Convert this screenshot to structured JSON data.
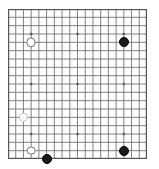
{
  "widget": {
    "name": "go-board",
    "board_size": 19,
    "background_color": "#ffffff",
    "board_color": "#fdfdfd",
    "line_color": "#6e6e6e",
    "border_color": "#555555",
    "black_color": "#1a1a1a",
    "white_color": "#ffffff"
  },
  "board": {
    "columns": 19,
    "rows": 19,
    "origin_x": 8,
    "origin_y": 9,
    "cell_size": 7.72,
    "star_points": [
      {
        "col": 3,
        "row": 3
      },
      {
        "col": 9,
        "row": 3
      },
      {
        "col": 15,
        "row": 3
      },
      {
        "col": 3,
        "row": 9
      },
      {
        "col": 9,
        "row": 9
      },
      {
        "col": 15,
        "row": 9
      },
      {
        "col": 3,
        "row": 15
      },
      {
        "col": 9,
        "row": 15
      },
      {
        "col": 15,
        "row": 15
      }
    ]
  },
  "stones": [
    {
      "id": "w1",
      "color": "white",
      "col": 3,
      "row": 4,
      "radius": 4.6,
      "faint": false,
      "label": "white-stone-upper-left"
    },
    {
      "id": "b1",
      "color": "black",
      "col": 15,
      "row": 4,
      "radius": 5.0,
      "faint": false,
      "label": "black-stone-upper-right"
    },
    {
      "id": "w2",
      "color": "white",
      "col": 2,
      "row": 13,
      "radius": 4.2,
      "faint": true,
      "label": "white-stone-left-middle"
    },
    {
      "id": "w3",
      "color": "white",
      "col": 3,
      "row": 17,
      "radius": 4.4,
      "faint": false,
      "label": "white-stone-lower-left"
    },
    {
      "id": "b2",
      "color": "black",
      "col": 5,
      "row": 18,
      "radius": 5.0,
      "faint": false,
      "label": "black-stone-bottom-left"
    },
    {
      "id": "b3",
      "color": "black",
      "col": 15,
      "row": 17,
      "radius": 5.0,
      "faint": false,
      "label": "black-stone-lower-right"
    }
  ]
}
